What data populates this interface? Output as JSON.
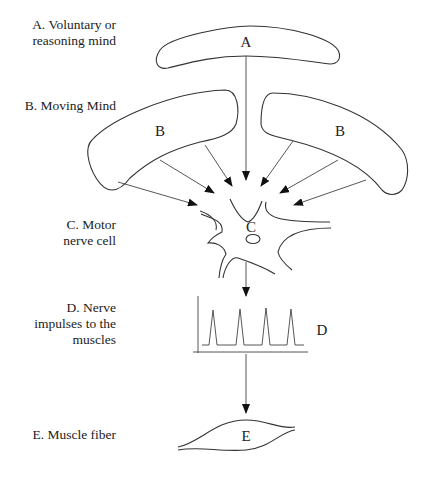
{
  "labels": {
    "a": {
      "line1": "A. Voluntary or",
      "line2": "reasoning mind"
    },
    "b": {
      "line1": "B. Moving Mind"
    },
    "c": {
      "line1": "C. Motor",
      "line2": "nerve cell"
    },
    "d": {
      "line1": "D. Nerve",
      "line2": "impulses to the",
      "line3": "muscles"
    },
    "e": {
      "line1": "E. Muscle fiber"
    }
  },
  "shapes": {
    "a": "A",
    "b_left": "B",
    "b_right": "B",
    "c": "C",
    "d": "D",
    "e": "E"
  },
  "impulse_chart": {
    "spike_count": 4
  }
}
